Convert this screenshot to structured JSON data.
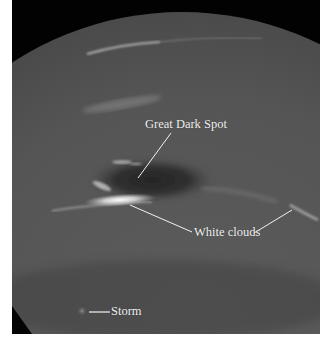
{
  "figure": {
    "background_color": "#020202",
    "planet_color": "#5a5a5a",
    "annotation_color": "#f2f2f2"
  },
  "labels": {
    "great_dark_spot": "Great Dark Spot",
    "white_clouds": "White clouds",
    "storm": "Storm"
  }
}
